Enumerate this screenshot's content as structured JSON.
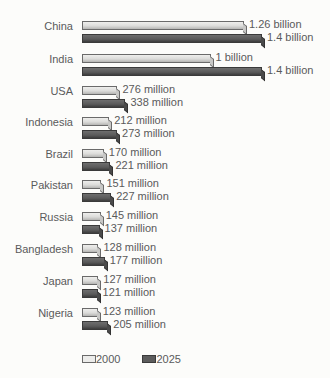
{
  "chart_data": {
    "type": "bar",
    "orientation": "horizontal",
    "title": "",
    "xlabel": "",
    "ylabel": "",
    "categories": [
      "China",
      "India",
      "USA",
      "Indonesia",
      "Brazil",
      "Pakistan",
      "Russia",
      "Bangladesh",
      "Japan",
      "Nigeria"
    ],
    "series": [
      {
        "name": "2000",
        "values_millions": [
          1260,
          1000,
          276,
          212,
          170,
          151,
          145,
          128,
          127,
          123
        ],
        "labels": [
          "1.26 billion",
          "1 billion",
          "276 million",
          "212 million",
          "170 million",
          "151 million",
          "145 million",
          "128 million",
          "127 million",
          "123 million"
        ],
        "color": "#e6e6e4"
      },
      {
        "name": "2025",
        "values_millions": [
          1400,
          1400,
          338,
          273,
          221,
          227,
          137,
          177,
          121,
          205
        ],
        "labels": [
          "1.4 billion",
          "1.4 billion",
          "338 million",
          "273 million",
          "221 million",
          "227 million",
          "137 million",
          "177 million",
          "121 million",
          "205 million"
        ],
        "color": "#555555"
      }
    ],
    "legend": {
      "position": "bottom-left",
      "entries": [
        "2000",
        "2025"
      ]
    },
    "grid": false
  },
  "legend": {
    "label_2000": "2000",
    "label_2025": "2025"
  }
}
